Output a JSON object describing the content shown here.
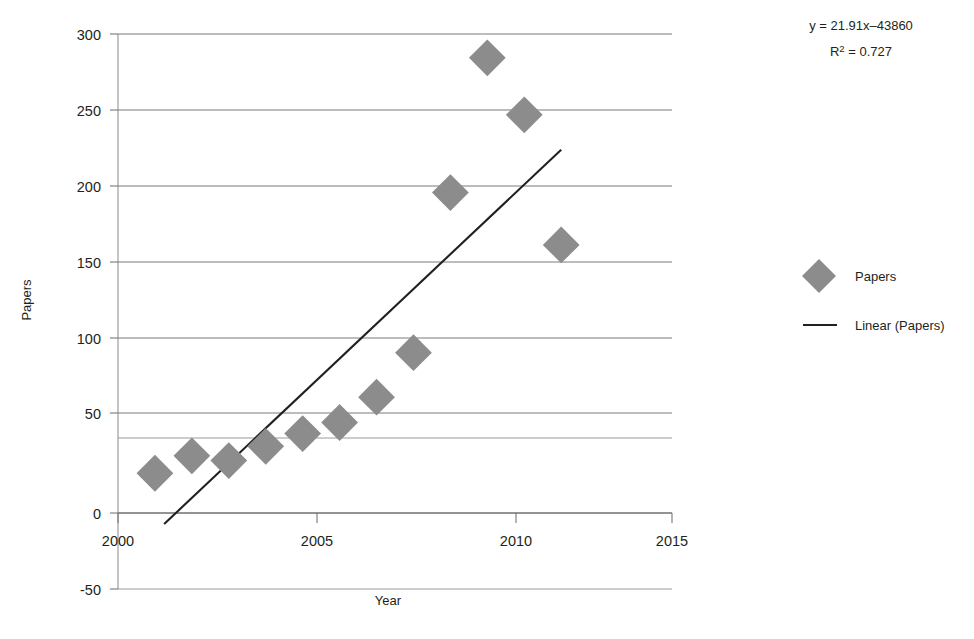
{
  "chart_data": {
    "type": "scatter",
    "title": "",
    "xlabel": "Year",
    "ylabel": "Papers",
    "xlim": [
      2000,
      2015
    ],
    "ylim": [
      -50,
      300
    ],
    "xticks": [
      2000,
      2005,
      2010,
      2015
    ],
    "yticks": [
      -50,
      0,
      50,
      100,
      150,
      200,
      250,
      300
    ],
    "xtick_labels": [
      "2000",
      "2005",
      "2010",
      "2015"
    ],
    "ytick_labels": [
      "-50",
      "0",
      "50",
      "100",
      "150",
      "200",
      "250",
      "300"
    ],
    "grid": "horizontal",
    "legend_position": "right",
    "marker_color": "#8c8c8c",
    "trendline_color": "#231f20",
    "series": [
      {
        "name": "Papers",
        "type": "scatter",
        "marker": "diamond",
        "x": [
          2001,
          2002,
          2003,
          2004,
          2005,
          2006,
          2007,
          2008,
          2009,
          2010,
          2011,
          2012
        ],
        "values": [
          23,
          34,
          31,
          40,
          48,
          55,
          71,
          99,
          200,
          285,
          249,
          167
        ]
      },
      {
        "name": "Linear (Papers)",
        "type": "line",
        "x": [
          2001.25,
          2012.0
        ],
        "values": [
          -9,
          227
        ]
      }
    ],
    "annotations": [
      {
        "id": "equation",
        "text": "y = 21.91x–43860"
      },
      {
        "id": "r_squared",
        "prefix": "R",
        "superscript": "2",
        "suffix": " = 0.727"
      }
    ],
    "legend_entries": [
      {
        "label": "Papers",
        "marker": "diamond",
        "color": "#8c8c8c"
      },
      {
        "label": "Linear (Papers)",
        "marker": "line",
        "color": "#231f20"
      }
    ],
    "regression": {
      "slope": 21.91,
      "intercept": -43860,
      "r_squared": 0.727
    }
  },
  "labels": {
    "y_axis_title": "Papers",
    "x_axis_title": "Year"
  }
}
